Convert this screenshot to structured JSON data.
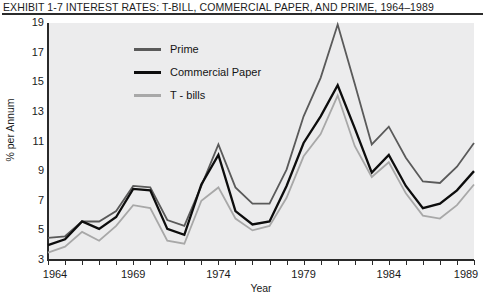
{
  "exhibit": {
    "label": "EXHIBIT 1-7",
    "title": "EXHIBIT 1-7   INTEREST RATES: T-BILL, COMMERCIAL PAPER, AND PRIME, 1964–1989"
  },
  "legend": {
    "position": "inside-top-left",
    "items": [
      {
        "label": "Prime",
        "color": "#5a5a5a"
      },
      {
        "label": "Commercial Paper",
        "color": "#0d0d0d"
      },
      {
        "label": "T - bills",
        "color": "#a8a8a8"
      }
    ]
  },
  "axes": {
    "y": {
      "label": "% per Annum",
      "ticks": [
        "3",
        "5",
        "7",
        "9",
        "11",
        "13",
        "15",
        "17",
        "19"
      ],
      "min": 3,
      "max": 19
    },
    "x": {
      "label": "Year",
      "ticks": [
        "1964",
        "1969",
        "1974",
        "1979",
        "1984",
        "1989"
      ],
      "min": 1964,
      "max": 1989
    }
  },
  "chart_data": {
    "type": "line",
    "title": "EXHIBIT 1-7   INTEREST RATES: T-BILL, COMMERCIAL PAPER, AND PRIME, 1964–1989",
    "xlabel": "Year",
    "ylabel": "% per Annum",
    "xlim": [
      1964,
      1989
    ],
    "ylim": [
      3,
      19
    ],
    "grid": false,
    "plot_background": "#ececed",
    "legend_position": "inside-top-left",
    "x": [
      1964,
      1965,
      1966,
      1967,
      1968,
      1969,
      1970,
      1971,
      1972,
      1973,
      1974,
      1975,
      1976,
      1977,
      1978,
      1979,
      1980,
      1981,
      1982,
      1983,
      1984,
      1985,
      1986,
      1987,
      1988,
      1989
    ],
    "series": [
      {
        "name": "Prime",
        "color": "#5a5a5a",
        "values": [
          4.5,
          4.6,
          5.6,
          5.6,
          6.3,
          8.0,
          7.9,
          5.7,
          5.3,
          8.0,
          10.8,
          7.9,
          6.8,
          6.8,
          9.1,
          12.7,
          15.3,
          18.9,
          14.9,
          10.8,
          12.0,
          9.9,
          8.3,
          8.2,
          9.3,
          10.9
        ]
      },
      {
        "name": "Commercial Paper",
        "color": "#0d0d0d",
        "values": [
          4.0,
          4.4,
          5.6,
          5.1,
          5.9,
          7.8,
          7.7,
          5.1,
          4.7,
          8.1,
          10.1,
          6.3,
          5.4,
          5.6,
          8.0,
          10.9,
          12.7,
          14.8,
          11.9,
          8.9,
          10.1,
          8.0,
          6.5,
          6.8,
          7.7,
          9.0
        ]
      },
      {
        "name": "T - bills",
        "color": "#a8a8a8",
        "values": [
          3.5,
          3.9,
          4.9,
          4.3,
          5.3,
          6.7,
          6.5,
          4.3,
          4.1,
          7.0,
          7.9,
          5.8,
          5.0,
          5.3,
          7.2,
          10.0,
          11.5,
          14.1,
          10.7,
          8.6,
          9.6,
          7.5,
          6.0,
          5.8,
          6.7,
          8.1
        ]
      }
    ]
  }
}
